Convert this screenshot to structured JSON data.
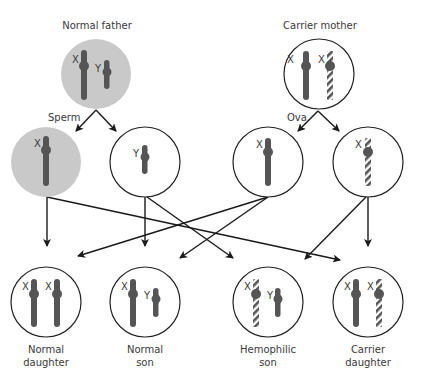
{
  "colors": {
    "chromosome": "#555555",
    "parent_fill": "#c9c9c9",
    "outline": "#222222",
    "arrow": "#1a1a1a"
  },
  "parents": {
    "father": {
      "label": "Normal father",
      "chromosomes": [
        "X",
        "Y"
      ]
    },
    "mother": {
      "label": "Carrier mother",
      "chromosomes": [
        "X",
        "Xh"
      ]
    }
  },
  "gametes": {
    "sperm_label": "Sperm",
    "ova_label": "Ova",
    "sperm": [
      {
        "chromosome": "X",
        "label": "X"
      },
      {
        "chromosome": "Y",
        "label": "Y"
      }
    ],
    "ova": [
      {
        "chromosome": "X",
        "label": "X"
      },
      {
        "chromosome": "Xh",
        "label": "X"
      }
    ]
  },
  "offspring": [
    {
      "label_line1": "Normal",
      "label_line2": "daughter",
      "chromosomes": [
        "X",
        "X"
      ]
    },
    {
      "label_line1": "Normal",
      "label_line2": "son",
      "chromosomes": [
        "X",
        "Y"
      ]
    },
    {
      "label_line1": "Hemophilic",
      "label_line2": "son",
      "chromosomes": [
        "Xh",
        "Y"
      ]
    },
    {
      "label_line1": "Carrier",
      "label_line2": "daughter",
      "chromosomes": [
        "X",
        "Xh"
      ]
    }
  ],
  "chromosome_labels": {
    "x": "X",
    "y": "Y"
  }
}
